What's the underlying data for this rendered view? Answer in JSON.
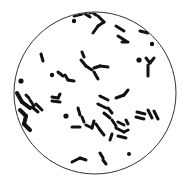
{
  "image": {
    "subject": "microscope field of view with bacteria",
    "field_border_color": "#333333",
    "background_color": "#ffffff",
    "organism_color": "#111111",
    "organisms": {
      "rods_label": "rod-shaped bacteria (bacilli)",
      "cocci_label": "round bacteria (cocci)"
    }
  }
}
